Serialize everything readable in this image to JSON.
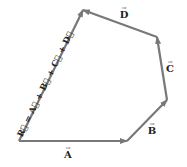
{
  "diagram": {
    "colors": {
      "vector_line": "#787878",
      "label_text": "#222222",
      "background": "#ffffff"
    },
    "points": {
      "origin": [
        19,
        141
      ],
      "p1": [
        127,
        141
      ],
      "p2": [
        167,
        100
      ],
      "p3": [
        157,
        37
      ],
      "p4": [
        83,
        10
      ]
    },
    "vectors": [
      {
        "name": "A",
        "label": "A",
        "from": "origin",
        "to": "p1"
      },
      {
        "name": "B",
        "label": "B",
        "from": "p1",
        "to": "p2"
      },
      {
        "name": "C",
        "label": "C",
        "from": "p2",
        "to": "p3"
      },
      {
        "name": "D",
        "label": "D",
        "from": "p3",
        "to": "p4"
      },
      {
        "name": "R",
        "label": "R = A + B + C + D",
        "from": "origin",
        "to": "p4"
      }
    ],
    "labels": {
      "A": "A",
      "B": "B",
      "C": "C",
      "D": "D",
      "R_equation": "R⃗ = A⃗ + B⃗ + C⃗ + D⃗",
      "arrow": "→"
    }
  }
}
